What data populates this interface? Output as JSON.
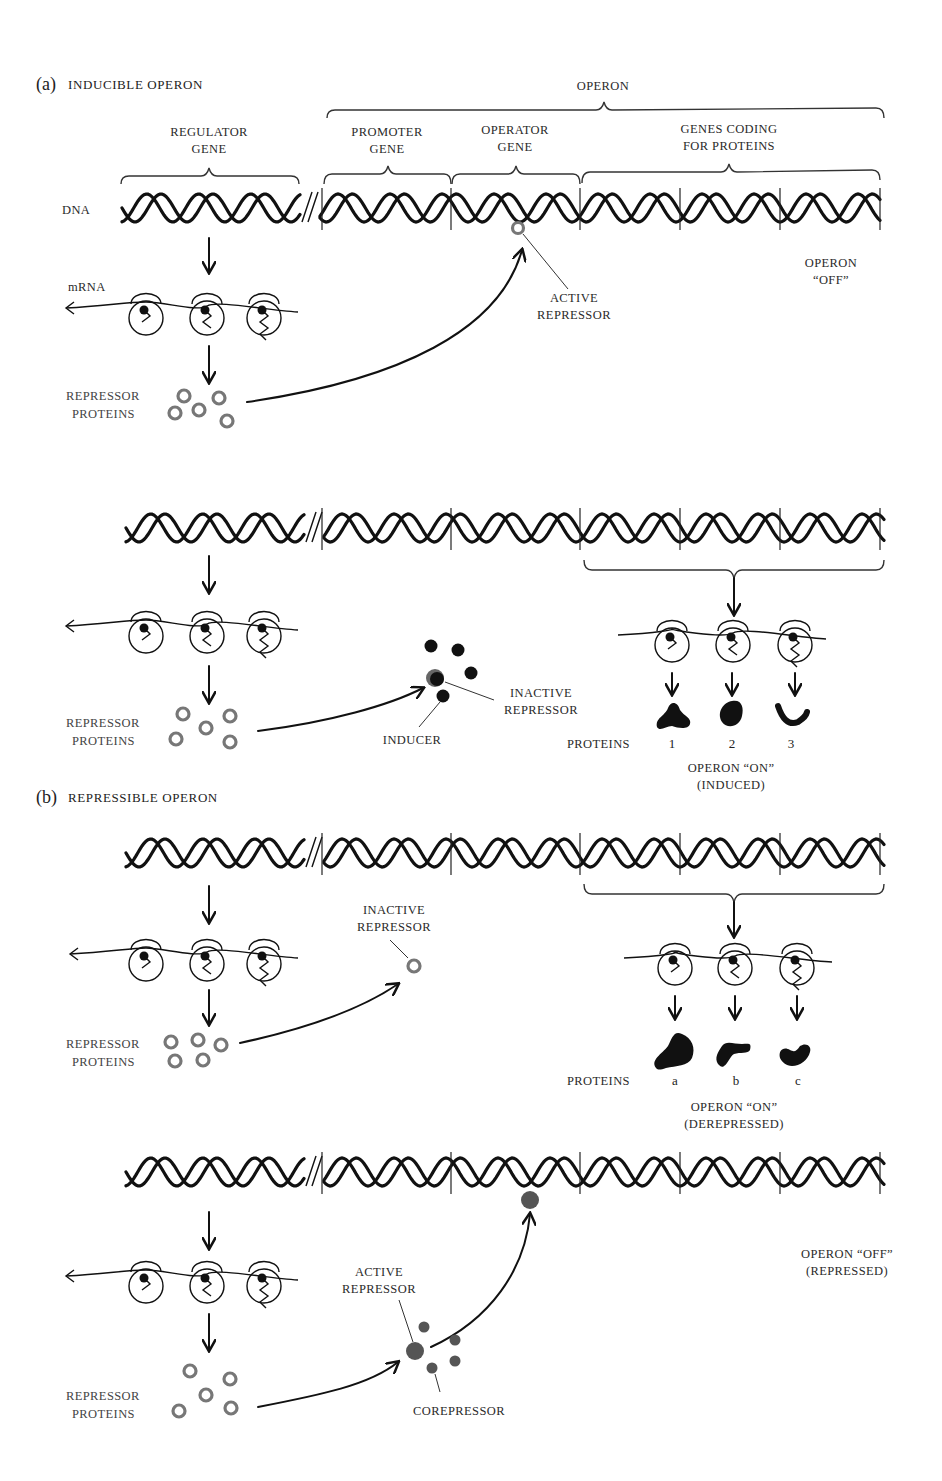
{
  "colors": {
    "ink": "#111111",
    "repressor_ring": "#777777",
    "inducer": "#111111",
    "corepressor": "#555555",
    "background": "#ffffff"
  },
  "part_a": {
    "letter": "(a)",
    "title": "INDUCIBLE OPERON",
    "labels": {
      "operon": "OPERON",
      "regulator_gene_1": "REGULATOR",
      "regulator_gene_2": "GENE",
      "promoter_gene_1": "PROMOTER",
      "promoter_gene_2": "GENE",
      "operator_gene_1": "OPERATOR",
      "operator_gene_2": "GENE",
      "genes_coding_1": "GENES CODING",
      "genes_coding_2": "FOR PROTEINS",
      "dna": "DNA",
      "mrna": "mRNA",
      "active_repressor_1": "ACTIVE",
      "active_repressor_2": "REPRESSOR",
      "operon_off_1": "OPERON",
      "operon_off_2": "“OFF”",
      "repressor_proteins_1": "REPRESSOR",
      "repressor_proteins_2": "PROTEINS"
    },
    "induced": {
      "repressor_proteins_1": "REPRESSOR",
      "repressor_proteins_2": "PROTEINS",
      "inducer": "INDUCER",
      "inactive_repressor_1": "INACTIVE",
      "inactive_repressor_2": "REPRESSOR",
      "proteins": "PROTEINS",
      "protein_ids": [
        "1",
        "2",
        "3"
      ],
      "state_1": "OPERON “ON”",
      "state_2": "(INDUCED)"
    }
  },
  "part_b": {
    "letter": "(b)",
    "title": "REPRESSIBLE OPERON",
    "derepressed": {
      "inactive_repressor_1": "INACTIVE",
      "inactive_repressor_2": "REPRESSOR",
      "repressor_proteins_1": "REPRESSOR",
      "repressor_proteins_2": "PROTEINS",
      "proteins": "PROTEINS",
      "protein_ids": [
        "a",
        "b",
        "c"
      ],
      "state_1": "OPERON  “ON”",
      "state_2": "(DEREPRESSED)"
    },
    "repressed": {
      "active_repressor_1": "ACTIVE",
      "active_repressor_2": "REPRESSOR",
      "corepressor": "COREPRESSOR",
      "repressor_proteins_1": "REPRESSOR",
      "repressor_proteins_2": "PROTEINS",
      "state_1": "OPERON  “OFF”",
      "state_2": "(REPRESSED)"
    }
  }
}
